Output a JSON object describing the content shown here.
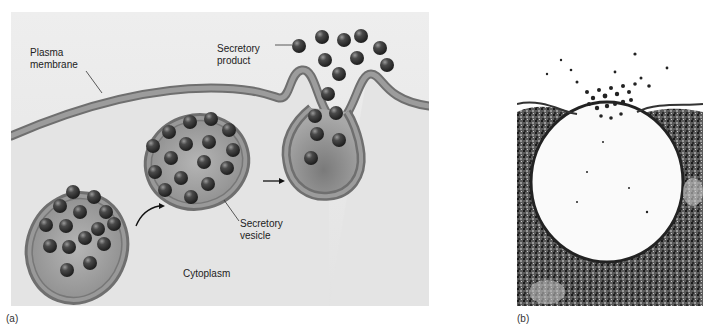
{
  "figure": {
    "panel_a": {
      "tag": "(a)",
      "labels": {
        "plasma_membrane": "Plasma\nmembrane",
        "secretory_product": "Secretory\nproduct",
        "secretory_vesicle": "Secretory\nvesicle",
        "cytoplasm": "Cytoplasm"
      }
    },
    "panel_b": {
      "tag": "(b)"
    }
  },
  "colors": {
    "background": "#e9e9e9",
    "membrane": "#8a8a8a",
    "vesicle_fill": "#9a9a9a",
    "granule": "#3a3a3a"
  }
}
